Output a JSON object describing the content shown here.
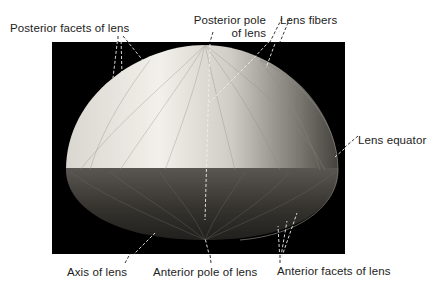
{
  "figure": {
    "background_color": "#000000",
    "lens_colors": {
      "posterior_light": "#e9e6e0",
      "anterior_dark": "#3a3835"
    }
  },
  "labels": {
    "posterior_facets": "Posterior facets of lens",
    "posterior_pole_line1": "Posterior pole",
    "posterior_pole_line2": "of lens",
    "lens_fibers": "Lens fibers",
    "lens_equator": "Lens equator",
    "axis": "Axis of lens",
    "anterior_pole": "Anterior pole of lens",
    "anterior_facets": "Anterior facets of lens"
  }
}
